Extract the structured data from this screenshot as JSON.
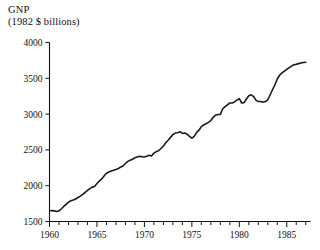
{
  "chart_data": {
    "type": "line",
    "title": "GNP",
    "subtitle": "(1982 $ billions)",
    "xlabel": "",
    "ylabel": "",
    "xlim": [
      1960,
      1987.5
    ],
    "ylim": [
      1500,
      4000
    ],
    "yticks": [
      1500,
      2000,
      2500,
      3000,
      3500,
      4000
    ],
    "ytick_labels": [
      "1500",
      "2000",
      "2500",
      "3000",
      "3500",
      "4000"
    ],
    "xticks": [
      1960,
      1965,
      1970,
      1975,
      1980,
      1985
    ],
    "xtick_labels": [
      "1960",
      "1965",
      "1970",
      "1975",
      "1980",
      "1985"
    ],
    "x_minor_tick_interval": 1,
    "grid": false,
    "legend": null,
    "series_name": "Real GNP",
    "line_color": "#1a1a1a",
    "x": [
      1960.0,
      1960.25,
      1960.5,
      1960.75,
      1961.0,
      1961.25,
      1961.5,
      1961.75,
      1962.0,
      1962.25,
      1962.5,
      1962.75,
      1963.0,
      1963.25,
      1963.5,
      1963.75,
      1964.0,
      1964.25,
      1964.5,
      1964.75,
      1965.0,
      1965.25,
      1965.5,
      1965.75,
      1966.0,
      1966.25,
      1966.5,
      1966.75,
      1967.0,
      1967.25,
      1967.5,
      1967.75,
      1968.0,
      1968.25,
      1968.5,
      1968.75,
      1969.0,
      1969.25,
      1969.5,
      1969.75,
      1970.0,
      1970.25,
      1970.5,
      1970.75,
      1971.0,
      1971.25,
      1971.5,
      1971.75,
      1972.0,
      1972.25,
      1972.5,
      1972.75,
      1973.0,
      1973.25,
      1973.5,
      1973.75,
      1974.0,
      1974.25,
      1974.5,
      1974.75,
      1975.0,
      1975.25,
      1975.5,
      1975.75,
      1976.0,
      1976.25,
      1976.5,
      1976.75,
      1977.0,
      1977.25,
      1977.5,
      1977.75,
      1978.0,
      1978.25,
      1978.5,
      1978.75,
      1979.0,
      1979.25,
      1979.5,
      1979.75,
      1980.0,
      1980.25,
      1980.5,
      1980.75,
      1981.0,
      1981.25,
      1981.5,
      1981.75,
      1982.0,
      1982.25,
      1982.5,
      1982.75,
      1983.0,
      1983.25,
      1983.5,
      1983.75,
      1984.0,
      1984.25,
      1984.5,
      1984.75,
      1985.0,
      1985.25,
      1985.5,
      1985.75,
      1986.0,
      1986.25,
      1986.5,
      1986.75,
      1987.0
    ],
    "values": [
      1650,
      1652,
      1648,
      1640,
      1648,
      1678,
      1710,
      1740,
      1770,
      1790,
      1800,
      1815,
      1835,
      1855,
      1880,
      1905,
      1935,
      1960,
      1980,
      1990,
      2030,
      2065,
      2095,
      2135,
      2175,
      2190,
      2205,
      2215,
      2225,
      2240,
      2260,
      2275,
      2310,
      2340,
      2355,
      2370,
      2390,
      2400,
      2410,
      2405,
      2400,
      2410,
      2425,
      2415,
      2455,
      2475,
      2490,
      2520,
      2555,
      2600,
      2635,
      2675,
      2715,
      2735,
      2740,
      2755,
      2730,
      2735,
      2720,
      2690,
      2665,
      2690,
      2745,
      2775,
      2825,
      2850,
      2865,
      2885,
      2910,
      2955,
      2985,
      2995,
      2995,
      3075,
      3105,
      3130,
      3155,
      3155,
      3170,
      3195,
      3215,
      3155,
      3160,
      3210,
      3255,
      3270,
      3245,
      3195,
      3175,
      3175,
      3165,
      3175,
      3200,
      3270,
      3340,
      3410,
      3490,
      3545,
      3575,
      3600,
      3625,
      3650,
      3670,
      3690,
      3695,
      3705,
      3715,
      3720,
      3725
    ]
  },
  "axes": {
    "y_axis_name": "y-axis",
    "x_axis_name": "x-axis"
  }
}
